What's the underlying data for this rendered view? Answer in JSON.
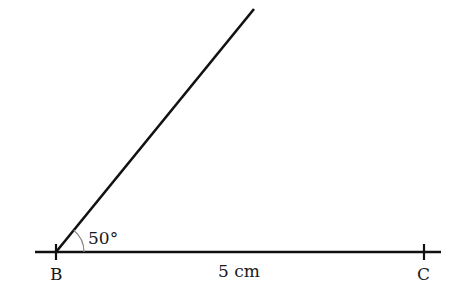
{
  "diagram": {
    "points": {
      "B": {
        "label": "B"
      },
      "C": {
        "label": "C"
      }
    },
    "segment_BC": {
      "label": "5 cm",
      "length_cm": 5
    },
    "angle_B": {
      "label": "50°",
      "degrees": 50
    },
    "colors": {
      "line": "#111111",
      "arc": "#888888"
    }
  }
}
